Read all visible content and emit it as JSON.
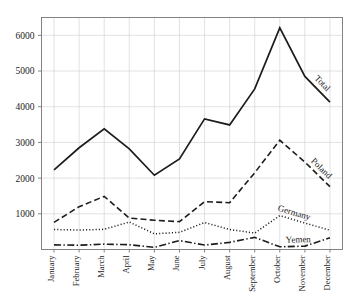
{
  "chart_data": {
    "type": "line",
    "title": "",
    "subtitle": "",
    "xlabel": "",
    "ylabel": "",
    "grid": true,
    "legend_position": "inline-end-of-line",
    "categories": [
      "January",
      "February",
      "March",
      "April",
      "May",
      "June",
      "July",
      "August",
      "September",
      "October",
      "November",
      "December"
    ],
    "ylim": [
      0,
      6500
    ],
    "yticks": [
      1000,
      2000,
      3000,
      4000,
      5000,
      6000
    ],
    "ytick_labels": [
      "1000",
      "2000",
      "3000",
      "4000",
      "5000",
      "6000"
    ],
    "series": [
      {
        "name": "Total",
        "line_style": "solid",
        "color": "#1c1c1c",
        "values": [
          2230,
          2850,
          3380,
          2820,
          2080,
          2540,
          3660,
          3490,
          4500,
          6210,
          4850,
          4130
        ]
      },
      {
        "name": "Poland",
        "line_style": "dashed",
        "color": "#1c1c1c",
        "values": [
          760,
          1200,
          1490,
          880,
          820,
          780,
          1340,
          1310,
          2150,
          3060,
          2450,
          1760
        ]
      },
      {
        "name": "Germany",
        "line_style": "dotted",
        "color": "#1c1c1c",
        "values": [
          560,
          545,
          565,
          770,
          440,
          480,
          755,
          560,
          460,
          950,
          740,
          540
        ]
      },
      {
        "name": "Yemen",
        "line_style": "dashdot",
        "color": "#1c1c1c",
        "values": [
          130,
          120,
          150,
          135,
          60,
          250,
          125,
          200,
          340,
          75,
          95,
          330
        ]
      }
    ]
  },
  "axis": {
    "y_tick_texts": [
      "6000",
      "5000",
      "4000",
      "3000",
      "2000",
      "1000"
    ],
    "x_tick_texts": [
      "January",
      "February",
      "March",
      "April",
      "May",
      "June",
      "July",
      "August",
      "September",
      "October",
      "November",
      "December"
    ]
  },
  "series_labels": {
    "total": "Total",
    "poland": "Poland",
    "germany": "Germany",
    "yemen": "Yemen"
  },
  "colors": {
    "ink": "#1c1c1c",
    "grid": "#cfcfd4",
    "frame": "#777777",
    "background": "#ffffff"
  }
}
